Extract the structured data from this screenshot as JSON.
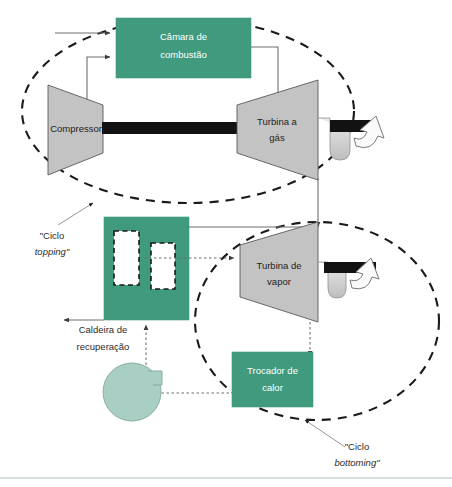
{
  "diagram": {
    "palette": {
      "green_fill": "#409a7e",
      "gray_fill": "#c3c3c3",
      "gray_stroke": "#5a5a5a",
      "pump_fill": "#a9cec3",
      "shaft_black": "#121212",
      "line_gray": "#6e6e6e",
      "dash_black": "#1a1a1a",
      "frame_line": "#a9c3bc",
      "label_white": "#ffffff",
      "label_dark": "#1d1d1d"
    },
    "blocks": {
      "combustion_chamber": {
        "label_line1": "Câmara de",
        "label_line2": "combustão",
        "type": "rect",
        "fill": "green"
      },
      "compressor": {
        "label": "Compressor",
        "type": "trapezoid",
        "fill": "gray"
      },
      "gas_turbine": {
        "label_line1": "Turbina a",
        "label_line2": "gás",
        "type": "trapezoid",
        "fill": "gray"
      },
      "recovery_boiler": {
        "label_line1": "Caldeira de",
        "label_line2": "recuperação",
        "type": "rect-with-tubes",
        "fill": "green",
        "tube_count": 2
      },
      "steam_turbine": {
        "label_line1": "Turbina de",
        "label_line2": "vapor",
        "type": "trapezoid",
        "fill": "gray"
      },
      "heat_exchanger": {
        "label_line1": "Trocador de",
        "label_line2": "calor",
        "type": "rect",
        "fill": "green"
      },
      "pump": {
        "label": "",
        "type": "circle-with-tab",
        "fill": "pump"
      }
    },
    "cycles": [
      {
        "id": "topping",
        "caption_line1": "\"Ciclo",
        "caption_line2": "topping\"",
        "italic_line": 2
      },
      {
        "id": "bottoming",
        "caption_line1": "\"Ciclo",
        "caption_line2": "bottoming\"",
        "italic_line": 2
      }
    ],
    "flows": [
      {
        "id": "air-inlet",
        "style": "solid",
        "from": "external",
        "to": "combustion_chamber"
      },
      {
        "id": "compressor-to-chamber",
        "style": "solid",
        "from": "compressor",
        "to": "combustion_chamber"
      },
      {
        "id": "chamber-to-gas-turbine",
        "style": "solid",
        "from": "combustion_chamber",
        "to": "gas_turbine"
      },
      {
        "id": "gas-turbine-exhaust-to-boiler",
        "style": "solid",
        "from": "gas_turbine",
        "to": "recovery_boiler"
      },
      {
        "id": "boiler-stack-out",
        "style": "solid",
        "from": "recovery_boiler",
        "to": "external"
      },
      {
        "id": "boiler-steam-to-steam-turbine",
        "style": "dotted",
        "from": "recovery_boiler",
        "to": "steam_turbine"
      },
      {
        "id": "steam-turbine-to-heat-exchanger",
        "style": "dotted",
        "from": "steam_turbine",
        "to": "heat_exchanger"
      },
      {
        "id": "heat-exchanger-to-pump",
        "style": "dotted",
        "from": "heat_exchanger",
        "to": "pump"
      },
      {
        "id": "pump-to-boiler",
        "style": "dotted",
        "from": "pump",
        "to": "recovery_boiler"
      }
    ],
    "generators": [
      {
        "id": "gas-turbine-shaft-generator",
        "attached_to": "gas_turbine"
      },
      {
        "id": "steam-turbine-shaft-generator",
        "attached_to": "steam_turbine"
      }
    ]
  }
}
